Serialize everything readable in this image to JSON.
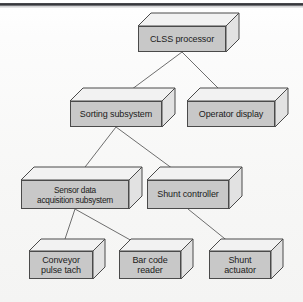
{
  "figure": {
    "kind": "3d-block-hierarchy-diagram",
    "background_color": "#fbfbfb",
    "box_front_color": "#c8c8c8",
    "box_top_color": "#f2f2f2",
    "box_side_color": "#e2e2e2",
    "box_outline_color": "#4a4a4a",
    "connector_color": "#6e6e6e",
    "rule_color": "#2e2f33"
  },
  "nodes": [
    {
      "id": "clss-processor",
      "label": "CLSS processor",
      "lines": [
        "CLSS processor"
      ],
      "x": 138,
      "y": 26,
      "w": 88,
      "h": 26,
      "depth": 13
    },
    {
      "id": "sorting-subsystem",
      "label": "Sorting subsystem",
      "lines": [
        "Sorting subsystem"
      ],
      "x": 70,
      "y": 101,
      "w": 92,
      "h": 26,
      "depth": 13
    },
    {
      "id": "operator-display",
      "label": "Operator display",
      "lines": [
        "Operator display"
      ],
      "x": 187,
      "y": 101,
      "w": 88,
      "h": 26,
      "depth": 13
    },
    {
      "id": "sensor-data-acquisition-subsystem",
      "label": "Sensor data acquisition subsystem",
      "lines": [
        "Sensor data",
        "acquisition subsystem"
      ],
      "x": 21,
      "y": 180,
      "w": 108,
      "h": 29,
      "depth": 13
    },
    {
      "id": "shunt-controller",
      "label": "Shunt controller",
      "lines": [
        "Shunt controller"
      ],
      "x": 147,
      "y": 180,
      "w": 82,
      "h": 29,
      "depth": 13
    },
    {
      "id": "conveyor-pulse-tach",
      "label": "Conveyor pulse tach",
      "lines": [
        "Conveyor",
        "pulse tach"
      ],
      "x": 29,
      "y": 251,
      "w": 64,
      "h": 28,
      "depth": 12
    },
    {
      "id": "bar-code-reader",
      "label": "Bar code reader",
      "lines": [
        "Bar code",
        "reader"
      ],
      "x": 119,
      "y": 251,
      "w": 62,
      "h": 28,
      "depth": 12
    },
    {
      "id": "shunt-actuator",
      "label": "Shunt actuator",
      "lines": [
        "Shunt",
        "actuator"
      ],
      "x": 209,
      "y": 251,
      "w": 62,
      "h": 28,
      "depth": 12
    }
  ],
  "edges": [
    {
      "from": "clss-processor",
      "to": "sorting-subsystem",
      "x1": 182,
      "y1": 52,
      "x2": 116,
      "y2": 101
    },
    {
      "from": "clss-processor",
      "to": "operator-display",
      "x1": 182,
      "y1": 52,
      "x2": 231,
      "y2": 101
    },
    {
      "from": "sorting-subsystem",
      "to": "sensor-data-acquisition-subsystem",
      "x1": 116,
      "y1": 127,
      "x2": 75,
      "y2": 180
    },
    {
      "from": "sorting-subsystem",
      "to": "shunt-controller",
      "x1": 116,
      "y1": 127,
      "x2": 188,
      "y2": 180
    },
    {
      "from": "sensor-data-acquisition-subsystem",
      "to": "conveyor-pulse-tach",
      "x1": 75,
      "y1": 209,
      "x2": 61,
      "y2": 251
    },
    {
      "from": "sensor-data-acquisition-subsystem",
      "to": "bar-code-reader",
      "x1": 75,
      "y1": 209,
      "x2": 150,
      "y2": 251
    },
    {
      "from": "shunt-controller",
      "to": "shunt-actuator",
      "x1": 188,
      "y1": 209,
      "x2": 240,
      "y2": 251
    }
  ]
}
